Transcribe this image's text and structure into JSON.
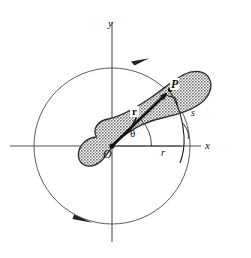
{
  "figure": {
    "kind": "mechanics-diagram",
    "background_color": "#ffffff",
    "line_color": "#1a1a1a",
    "thin_line_color": "#555555",
    "body_fill_color": "#8c8c8c",
    "body_outline_color": "#2b2b2b"
  },
  "axes": {
    "x_label": "x",
    "y_label": "y",
    "origin_label": "O",
    "origin_px": {
      "x": 112,
      "y": 146
    }
  },
  "labels": {
    "point_p": "P",
    "vector_r": "r",
    "angle_theta": "θ",
    "arc_s": "s",
    "radius_r": "r"
  },
  "circle": {
    "center_px": {
      "x": 112,
      "y": 146
    },
    "radius_px": 78,
    "rotation_arrow_top": true,
    "rotation_arrow_bottom": true
  },
  "vector": {
    "from_px": {
      "x": 112,
      "y": 146
    },
    "to_px": {
      "x": 170,
      "y": 90
    },
    "arrowhead": true
  },
  "angle": {
    "value_label": "θ",
    "arc_start_deg": 0,
    "arc_end_deg": 44
  }
}
